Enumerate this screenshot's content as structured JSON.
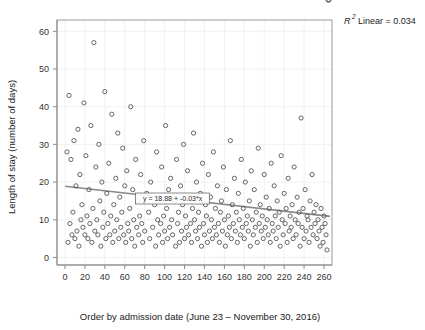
{
  "chart_data": {
    "type": "scatter",
    "title": "",
    "xlabel": "Order by admission date (June 23 – November 30, 2016)",
    "ylabel": "Length of stay (number of days)",
    "xlim": [
      -8,
      268
    ],
    "ylim": [
      -2,
      63
    ],
    "xticks": [
      0,
      20,
      40,
      60,
      80,
      100,
      120,
      140,
      160,
      180,
      200,
      220,
      240,
      260
    ],
    "yticks": [
      0,
      10,
      20,
      30,
      40,
      50,
      60
    ],
    "grid": true,
    "legend": "none",
    "marker": "open-circle",
    "marker_color": "#555555",
    "annotations": {
      "r2_prefix": "R",
      "r2_exponent": "2",
      "r2_text": "Linear = 0.034",
      "r2_value": 0.034,
      "equation": "y = 18.88 + -0.03*x",
      "equation_intercept": 18.88,
      "equation_slope": -0.03
    },
    "fit_line": {
      "type": "linear",
      "intercept": 18.88,
      "slope": -0.03,
      "color": "#8a8a8a",
      "x_start": 0,
      "x_end": 266
    },
    "x": [
      2,
      3,
      4,
      5,
      6,
      7,
      8,
      9,
      10,
      11,
      12,
      13,
      14,
      15,
      16,
      17,
      18,
      19,
      20,
      21,
      22,
      23,
      24,
      25,
      26,
      27,
      28,
      29,
      30,
      31,
      32,
      33,
      34,
      35,
      36,
      37,
      38,
      39,
      40,
      41,
      42,
      43,
      44,
      45,
      46,
      47,
      48,
      49,
      50,
      51,
      52,
      53,
      54,
      55,
      56,
      57,
      58,
      59,
      60,
      61,
      62,
      63,
      64,
      65,
      66,
      67,
      68,
      69,
      70,
      71,
      72,
      73,
      74,
      75,
      76,
      77,
      78,
      79,
      80,
      82,
      84,
      85,
      86,
      88,
      90,
      91,
      92,
      93,
      94,
      95,
      96,
      97,
      98,
      99,
      100,
      101,
      102,
      103,
      104,
      105,
      106,
      107,
      108,
      110,
      111,
      112,
      113,
      114,
      115,
      116,
      117,
      118,
      119,
      120,
      121,
      122,
      123,
      124,
      125,
      126,
      127,
      128,
      129,
      130,
      131,
      132,
      133,
      134,
      135,
      136,
      137,
      138,
      139,
      140,
      141,
      142,
      143,
      144,
      145,
      146,
      147,
      148,
      149,
      150,
      151,
      152,
      153,
      154,
      155,
      156,
      157,
      158,
      159,
      160,
      161,
      162,
      163,
      164,
      165,
      166,
      167,
      168,
      169,
      170,
      171,
      172,
      173,
      174,
      175,
      176,
      177,
      178,
      179,
      180,
      181,
      182,
      183,
      184,
      185,
      186,
      187,
      188,
      189,
      190,
      191,
      192,
      193,
      194,
      195,
      196,
      197,
      198,
      199,
      200,
      201,
      202,
      203,
      204,
      205,
      206,
      207,
      208,
      209,
      210,
      211,
      212,
      213,
      214,
      215,
      216,
      217,
      218,
      219,
      220,
      221,
      222,
      223,
      224,
      225,
      226,
      227,
      228,
      229,
      230,
      231,
      232,
      233,
      234,
      235,
      236,
      237,
      238,
      239,
      240,
      241,
      242,
      243,
      244,
      245,
      246,
      247,
      248,
      249,
      250,
      251,
      252,
      253,
      254,
      255,
      256,
      257,
      258,
      259,
      260,
      261,
      262,
      263,
      264,
      265
    ],
    "y": [
      28,
      4,
      43,
      9,
      26,
      6,
      12,
      31,
      5,
      19,
      7,
      34,
      3,
      22,
      10,
      14,
      8,
      41,
      6,
      27,
      11,
      5,
      18,
      9,
      35,
      4,
      13,
      57,
      7,
      24,
      10,
      6,
      30,
      15,
      3,
      20,
      8,
      12,
      44,
      5,
      17,
      9,
      25,
      6,
      11,
      38,
      4,
      14,
      7,
      21,
      10,
      33,
      5,
      16,
      8,
      12,
      29,
      6,
      19,
      4,
      23,
      9,
      7,
      13,
      40,
      5,
      18,
      10,
      3,
      26,
      8,
      15,
      6,
      11,
      22,
      9,
      4,
      31,
      7,
      17,
      12,
      5,
      20,
      8,
      14,
      3,
      28,
      10,
      6,
      16,
      9,
      24,
      4,
      11,
      7,
      35,
      13,
      5,
      18,
      8,
      21,
      10,
      6,
      15,
      3,
      26,
      9,
      12,
      4,
      19,
      7,
      14,
      30,
      5,
      11,
      8,
      23,
      6,
      16,
      9,
      4,
      13,
      33,
      10,
      7,
      20,
      5,
      12,
      8,
      17,
      3,
      25,
      9,
      6,
      14,
      11,
      4,
      22,
      7,
      16,
      10,
      5,
      28,
      8,
      13,
      6,
      19,
      9,
      4,
      12,
      15,
      7,
      24,
      10,
      3,
      18,
      6,
      11,
      8,
      31,
      5,
      14,
      9,
      21,
      7,
      12,
      4,
      17,
      10,
      6,
      26,
      8,
      13,
      5,
      20,
      9,
      11,
      7,
      15,
      3,
      23,
      10,
      6,
      18,
      8,
      12,
      4,
      29,
      9,
      14,
      7,
      11,
      5,
      22,
      8,
      16,
      10,
      6,
      13,
      4,
      25,
      9,
      7,
      19,
      11,
      5,
      15,
      8,
      12,
      3,
      27,
      10,
      6,
      17,
      9,
      13,
      4,
      21,
      7,
      11,
      8,
      14,
      5,
      24,
      10,
      6,
      16,
      9,
      12,
      3,
      37,
      8,
      13,
      5,
      18,
      7,
      11,
      10,
      4,
      15,
      8,
      22,
      6,
      12,
      9,
      14,
      5,
      10,
      7,
      3,
      13,
      8,
      4,
      11,
      9,
      6,
      2
    ]
  }
}
